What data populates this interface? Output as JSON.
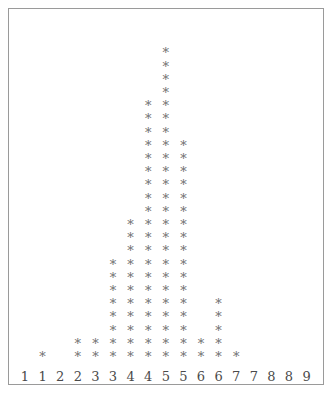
{
  "chart_data": {
    "type": "bar",
    "title": "",
    "subtitle": "",
    "xlabel": "",
    "ylabel": "",
    "glyph": "*",
    "glyph_color": "#6e6e6e",
    "frame_color": "#9a9a9a",
    "background": "#ffffff",
    "grid": false,
    "legend": null,
    "annotations": [],
    "categories": [
      "1",
      "1",
      "2",
      "2",
      "3",
      "3",
      "4",
      "4",
      "5",
      "5",
      "6",
      "6",
      "7",
      "7",
      "8",
      "8",
      "9"
    ],
    "values": [
      0,
      1,
      0,
      2,
      2,
      8,
      11,
      20,
      24,
      17,
      2,
      5,
      1,
      0,
      0,
      0,
      0
    ],
    "xlim": [
      0,
      17
    ],
    "ylim": [
      0,
      26
    ],
    "tick_labels": [
      "1",
      "1",
      "2",
      "2",
      "3",
      "3",
      "4",
      "4",
      "5",
      "5",
      "6",
      "6",
      "7",
      "7",
      "8",
      "8",
      "9"
    ],
    "max_value": 24,
    "max_category_index": 8,
    "total_count": 93
  },
  "figure": {
    "width": 333,
    "height": 393,
    "frame_visible": true
  }
}
